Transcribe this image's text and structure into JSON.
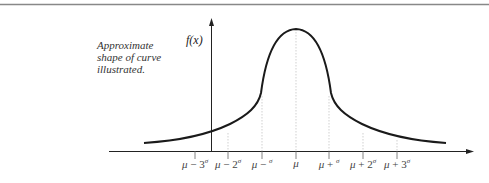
{
  "figure": {
    "caption_lines": [
      "Approximate",
      "shape of curve",
      "illustrated."
    ],
    "y_axis_label": "f(x)",
    "curve_type": "normal distribution (bell curve)",
    "ticks": [
      {
        "mu": "μ",
        "op": " − 3",
        "sigma": "σ",
        "x": 195
      },
      {
        "mu": "μ",
        "op": " − 2",
        "sigma": "σ",
        "x": 228
      },
      {
        "mu": "μ",
        "op": " − ",
        "sigma": "σ",
        "x": 262
      },
      {
        "mu": "μ",
        "op": "",
        "sigma": "",
        "x": 296
      },
      {
        "mu": "μ",
        "op": " + ",
        "sigma": "σ",
        "x": 329
      },
      {
        "mu": "μ",
        "op": " + 2",
        "sigma": "σ",
        "x": 363
      },
      {
        "mu": "μ",
        "op": " + 3",
        "sigma": "σ",
        "x": 397
      }
    ],
    "colors": {
      "curve": "#1a1a1a",
      "axis": "#222222",
      "guide": "#bbbbbb",
      "rule": "#888888"
    }
  }
}
